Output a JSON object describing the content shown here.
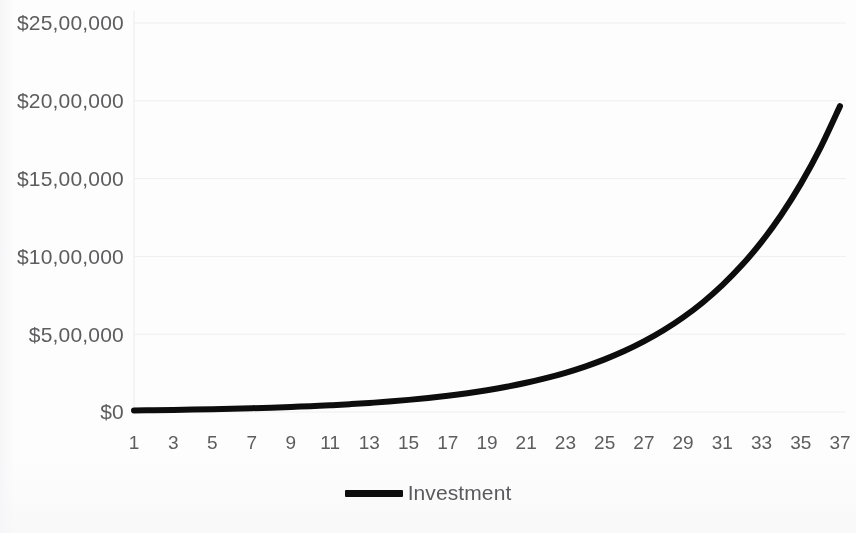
{
  "chart_data": {
    "type": "line",
    "title": "",
    "xlabel": "",
    "ylabel": "",
    "grid": true,
    "legend_position": "bottom",
    "xlim": [
      1,
      37
    ],
    "ylim": [
      0,
      2500000
    ],
    "y_tick_labels": [
      "$25,00,000",
      "$20,00,000",
      "$15,00,000",
      "$10,00,000",
      "$5,00,000",
      "$0"
    ],
    "y_tick_values": [
      2500000,
      2000000,
      1500000,
      1000000,
      500000,
      0
    ],
    "x_tick_labels": [
      "1",
      "3",
      "5",
      "7",
      "9",
      "11",
      "13",
      "15",
      "17",
      "19",
      "21",
      "23",
      "25",
      "27",
      "29",
      "31",
      "33",
      "35",
      "37"
    ],
    "x_tick_values": [
      1,
      3,
      5,
      7,
      9,
      11,
      13,
      15,
      17,
      19,
      21,
      23,
      25,
      27,
      29,
      31,
      33,
      35,
      37
    ],
    "series": [
      {
        "name": "Investment",
        "color": "#0d0d0d",
        "line_width": 6,
        "x": [
          1,
          2,
          3,
          4,
          5,
          6,
          7,
          8,
          9,
          10,
          11,
          12,
          13,
          14,
          15,
          16,
          17,
          18,
          19,
          20,
          21,
          22,
          23,
          24,
          25,
          26,
          27,
          28,
          29,
          30,
          31,
          32,
          33,
          34,
          35,
          36,
          37
        ],
        "values": [
          10000,
          11580,
          13410,
          15530,
          17980,
          20820,
          24110,
          27920,
          32330,
          37440,
          43360,
          50210,
          58140,
          67330,
          77970,
          90290,
          104560,
          121080,
          140210,
          162360,
          188010,
          217720,
          252130,
          291970,
          338100,
          391510,
          453370,
          525010,
          607960,
          704010,
          815240,
          944050,
          1093230,
          1266000,
          1466100,
          1697750,
          1965920
        ]
      }
    ],
    "legend_entries": [
      {
        "label": "Investment",
        "color": "#0d0d0d",
        "marker": "line"
      }
    ]
  },
  "legend": {
    "series_label": "Investment"
  },
  "colors": {
    "line": "#0d0d0d",
    "grid": "#efefef",
    "axis_text": "#5d5d5f",
    "background": "#fdfdfd"
  }
}
